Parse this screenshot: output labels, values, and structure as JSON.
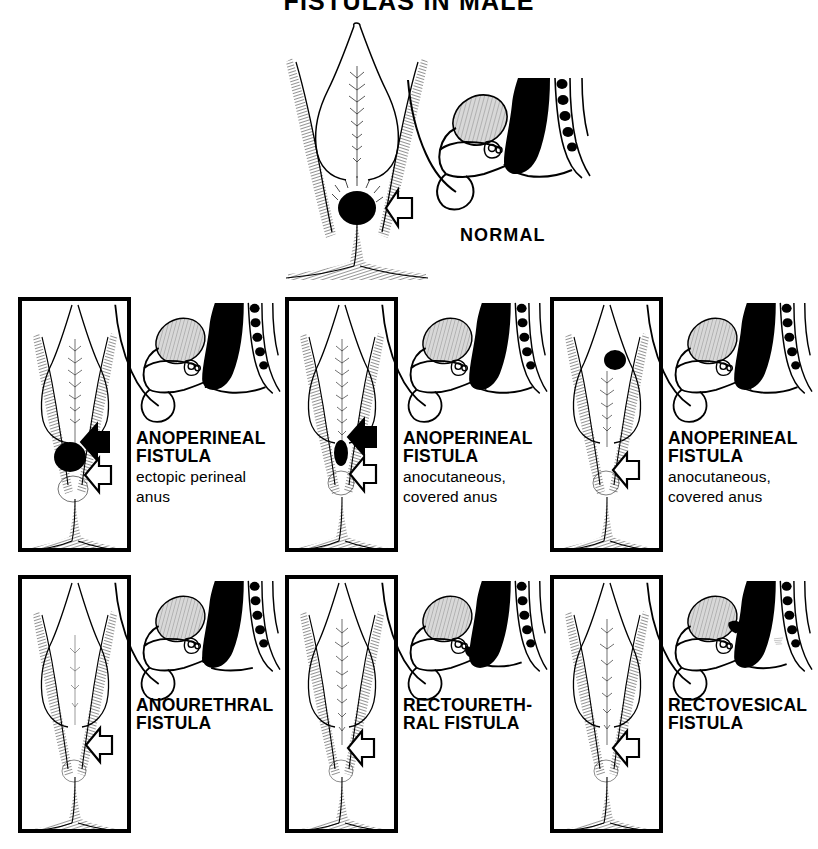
{
  "title": "FISTULAS IN MALE",
  "colors": {
    "ink": "#000000",
    "paper": "#ffffff",
    "rectum_fill": "#000000",
    "bladder_fill": "#cfcfcf",
    "fistula_marker": "#000000"
  },
  "normal": {
    "label": "NORMAL",
    "arrows": [
      "open-arrow-anus"
    ]
  },
  "panels": [
    {
      "id": "anoperineal-ectopic",
      "row": 1,
      "column": 1,
      "title_line1": "ANOPERINEAL",
      "title_line2": "FISTULA",
      "subtitle_line1": "ectopic perineal",
      "subtitle_line2": "anus",
      "markers": [
        "solid-arrow-fistula",
        "open-arrow-anus"
      ],
      "fistula_spot": true
    },
    {
      "id": "anoperineal-anocutaneous-1",
      "row": 1,
      "column": 2,
      "title_line1": "ANOPERINEAL",
      "title_line2": "FISTULA",
      "subtitle_line1": "anocutaneous,",
      "subtitle_line2": "covered anus",
      "markers": [
        "solid-arrow-fistula",
        "open-arrow-anus"
      ],
      "fistula_spot": true
    },
    {
      "id": "anoperineal-anocutaneous-2",
      "row": 1,
      "column": 3,
      "title_line1": "ANOPERINEAL",
      "title_line2": "FISTULA",
      "subtitle_line1": "anocutaneous,",
      "subtitle_line2": "covered anus",
      "markers": [
        "solid-spot-high",
        "open-arrow-anus"
      ],
      "fistula_spot": true
    },
    {
      "id": "anourethral",
      "row": 2,
      "column": 1,
      "title_line1": "ANOURETHRAL",
      "title_line2": "FISTULA",
      "subtitle_line1": "",
      "subtitle_line2": "",
      "markers": [
        "open-arrow-anus"
      ],
      "fistula_spot": false
    },
    {
      "id": "rectourethral",
      "row": 2,
      "column": 2,
      "title_line1": "RECTOURETH-",
      "title_line2": "RAL FISTULA",
      "subtitle_line1": "",
      "subtitle_line2": "",
      "markers": [
        "open-arrow-anus"
      ],
      "fistula_spot": false
    },
    {
      "id": "rectovesical",
      "row": 2,
      "column": 3,
      "title_line1": "RECTOVESICAL",
      "title_line2": "FISTULA",
      "subtitle_line1": "",
      "subtitle_line2": "",
      "markers": [
        "open-arrow-anus"
      ],
      "fistula_spot": false
    }
  ],
  "signature": "artist signature"
}
